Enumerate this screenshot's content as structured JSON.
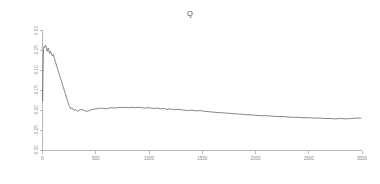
{
  "chart_data": {
    "type": "line",
    "title": "Q",
    "xlabel": "",
    "ylabel": "",
    "xlim": [
      0,
      3000
    ],
    "ylim": [
      -0.3,
      0.0
    ],
    "grid": false,
    "legend": null,
    "xticks": [
      0,
      500,
      1000,
      1500,
      2000,
      2500,
      3000
    ],
    "xticklabels": [
      "0",
      "500",
      "1000",
      "1500",
      "2000",
      "2500",
      "3000"
    ],
    "yticks": [
      0.0,
      -0.05,
      -0.1,
      -0.15,
      -0.2,
      -0.25,
      -0.3
    ],
    "yticklabels": [
      "0.00",
      "-0.05",
      "-0.10",
      "-0.15",
      "-0.20",
      "-0.25",
      "-0.30"
    ],
    "line_color": "#3a3a3a",
    "axis_color": "#9a9a9a",
    "series": [
      {
        "name": "Q",
        "x": [
          2,
          4,
          6,
          8,
          10,
          12,
          14,
          16,
          18,
          20,
          23,
          26,
          29,
          32,
          35,
          38,
          41,
          44,
          47,
          50,
          54,
          58,
          62,
          66,
          70,
          75,
          80,
          85,
          90,
          95,
          100,
          106,
          112,
          118,
          124,
          130,
          137,
          144,
          151,
          158,
          165,
          172,
          179,
          186,
          193,
          200,
          207,
          214,
          221,
          228,
          235,
          243,
          251,
          259,
          267,
          275,
          285,
          295,
          305,
          315,
          325,
          340,
          355,
          370,
          385,
          400,
          420,
          440,
          460,
          480,
          500,
          525,
          550,
          575,
          600,
          625,
          650,
          675,
          700,
          725,
          750,
          780,
          810,
          840,
          870,
          900,
          930,
          960,
          990,
          1020,
          1050,
          1080,
          1110,
          1140,
          1170,
          1200,
          1240,
          1280,
          1320,
          1360,
          1400,
          1440,
          1480,
          1520,
          1560,
          1600,
          1650,
          1700,
          1750,
          1800,
          1850,
          1900,
          1950,
          2000,
          2050,
          2100,
          2150,
          2200,
          2250,
          2300,
          2350,
          2400,
          2450,
          2500,
          2550,
          2600,
          2650,
          2700,
          2750,
          2800,
          2850,
          2900,
          2950,
          2990
        ],
        "y": [
          -0.175,
          -0.12,
          -0.085,
          -0.062,
          -0.048,
          -0.042,
          -0.04,
          -0.04,
          -0.041,
          -0.042,
          -0.04,
          -0.038,
          -0.037,
          -0.038,
          -0.041,
          -0.046,
          -0.05,
          -0.052,
          -0.05,
          -0.046,
          -0.044,
          -0.047,
          -0.053,
          -0.057,
          -0.055,
          -0.052,
          -0.055,
          -0.06,
          -0.063,
          -0.062,
          -0.06,
          -0.064,
          -0.07,
          -0.076,
          -0.081,
          -0.086,
          -0.092,
          -0.098,
          -0.104,
          -0.11,
          -0.116,
          -0.122,
          -0.128,
          -0.134,
          -0.14,
          -0.146,
          -0.152,
          -0.158,
          -0.164,
          -0.17,
          -0.176,
          -0.182,
          -0.188,
          -0.193,
          -0.196,
          -0.193,
          -0.196,
          -0.2,
          -0.197,
          -0.199,
          -0.202,
          -0.2,
          -0.198,
          -0.197,
          -0.199,
          -0.201,
          -0.202,
          -0.2,
          -0.198,
          -0.197,
          -0.196,
          -0.195,
          -0.194,
          -0.195,
          -0.196,
          -0.194,
          -0.193,
          -0.194,
          -0.193,
          -0.192,
          -0.193,
          -0.192,
          -0.193,
          -0.192,
          -0.193,
          -0.192,
          -0.193,
          -0.194,
          -0.193,
          -0.194,
          -0.195,
          -0.194,
          -0.196,
          -0.195,
          -0.197,
          -0.196,
          -0.198,
          -0.197,
          -0.199,
          -0.2,
          -0.199,
          -0.201,
          -0.2,
          -0.202,
          -0.203,
          -0.204,
          -0.205,
          -0.206,
          -0.207,
          -0.208,
          -0.209,
          -0.21,
          -0.211,
          -0.212,
          -0.213,
          -0.213,
          -0.214,
          -0.215,
          -0.215,
          -0.216,
          -0.217,
          -0.217,
          -0.218,
          -0.218,
          -0.219,
          -0.219,
          -0.22,
          -0.22,
          -0.221,
          -0.22,
          -0.221,
          -0.22,
          -0.219,
          -0.219
        ]
      }
    ]
  }
}
